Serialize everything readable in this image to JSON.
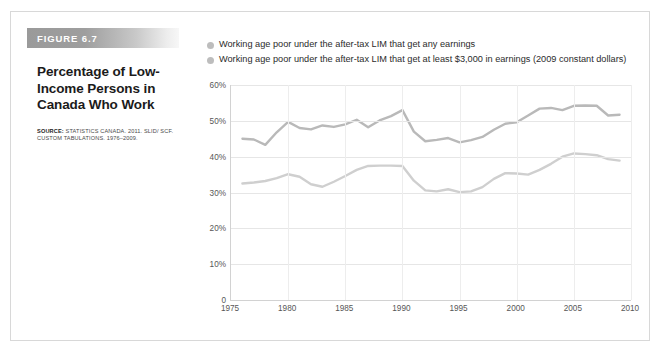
{
  "figure": {
    "banner_label": "FIGURE 6.7",
    "title_lines": [
      "Percentage of Low-",
      "Income Persons in",
      "Canada Who Work"
    ],
    "source_lead": "SOURCE:",
    "source_text": " STATISTICS CANADA. 2011. SLID/ SCF. CUSTOM TABULATIONS. 1976–2009."
  },
  "colors": {
    "series_any_earnings": "#b9b9b9",
    "series_min_3000": "#cfcfcf",
    "legend_dot": "#bdbdbd",
    "gridline": "#e6e6e6",
    "axis": "#d2d2d2",
    "banner_start": "#9a9a9a",
    "text_primary": "#1b1b1b",
    "text_muted": "#575757"
  },
  "chart_data": {
    "type": "line",
    "xlabel": "",
    "ylabel": "",
    "xlim": [
      1975,
      2010
    ],
    "ylim": [
      0,
      60
    ],
    "grid": true,
    "legend_position": "top",
    "y_ticks": [
      0,
      10,
      20,
      30,
      40,
      50,
      60
    ],
    "y_tick_labels": [
      "0",
      "10%",
      "20%",
      "30%",
      "40%",
      "50%",
      "60%"
    ],
    "x_ticks": [
      1975,
      1980,
      1985,
      1990,
      1995,
      2000,
      2005,
      2010
    ],
    "x_tick_labels": [
      "1975",
      "1980",
      "1985",
      "1990",
      "1995",
      "2000",
      "2005",
      "2010"
    ],
    "x": [
      1976,
      1977,
      1978,
      1979,
      1980,
      1981,
      1982,
      1983,
      1984,
      1985,
      1986,
      1987,
      1988,
      1989,
      1990,
      1991,
      1992,
      1993,
      1994,
      1995,
      1996,
      1997,
      1998,
      1999,
      2000,
      2001,
      2002,
      2003,
      2004,
      2005,
      2006,
      2007,
      2008,
      2009
    ],
    "series": [
      {
        "name": "Working age poor under the after-tax LIM that get any earnings",
        "color": "#b9b9b9",
        "values": [
          45.0,
          44.8,
          43.3,
          46.8,
          49.7,
          48.0,
          47.6,
          48.7,
          48.3,
          49.0,
          50.3,
          48.2,
          50.1,
          51.3,
          53.0,
          47.0,
          44.3,
          44.7,
          45.2,
          44.0,
          44.6,
          45.5,
          47.5,
          49.2,
          49.6,
          51.5,
          53.4,
          53.6,
          53.0,
          54.2,
          54.3,
          54.2,
          51.5,
          51.7
        ]
      },
      {
        "name": "Working age poor under the after-tax LIM that get at least $3,000 in earnings (2009 constant dollars)",
        "color": "#cfcfcf",
        "values": [
          32.5,
          32.8,
          33.2,
          34.0,
          35.1,
          34.4,
          32.3,
          31.6,
          33.0,
          34.6,
          36.3,
          37.4,
          37.5,
          37.5,
          37.4,
          33.3,
          30.6,
          30.3,
          30.9,
          30.1,
          30.3,
          31.5,
          33.8,
          35.4,
          35.3,
          35.0,
          36.3,
          38.0,
          40.0,
          40.9,
          40.7,
          40.4,
          39.3,
          38.9
        ]
      }
    ],
    "legend": [
      "Working age poor under the after-tax LIM that get any earnings",
      "Working age poor under the after-tax LIM that get at least $3,000 in earnings (2009 constant dollars)"
    ]
  }
}
